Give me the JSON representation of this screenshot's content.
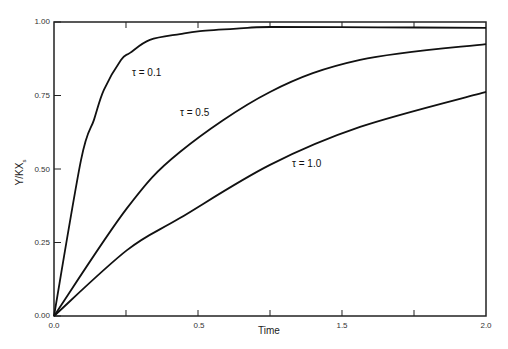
{
  "chart_data": {
    "type": "line",
    "title": "",
    "xlabel": "Time",
    "ylabel": "Y/KX_s",
    "ylabel_display": "Y/KX",
    "ylabel_sub": "s",
    "xlim": [
      0,
      2.0
    ],
    "ylim": [
      0,
      1.0
    ],
    "grid": false,
    "legend": "inline curve labels",
    "x_tick_labels": [
      {
        "pos": 0.0,
        "label": "0.0"
      },
      {
        "pos": 0.6667,
        "label": "0.5"
      },
      {
        "pos": 1.3333,
        "label": "1.5"
      },
      {
        "pos": 2.0,
        "label": "2.0"
      }
    ],
    "x_minor_ticks": [
      0.3333,
      0.6667,
      1.0,
      1.3333,
      1.6667
    ],
    "y_tick_labels": [
      {
        "pos": 0.0,
        "label": "0.00"
      },
      {
        "pos": 0.25,
        "label": "0.25"
      },
      {
        "pos": 0.5,
        "label": "0.50"
      },
      {
        "pos": 0.75,
        "label": "0.75"
      },
      {
        "pos": 1.0,
        "label": "1.00"
      }
    ],
    "series": [
      {
        "name": "τ = 0.1",
        "label_pos": [
          0.36,
          0.86
        ],
        "x": [
          0,
          0.125,
          0.185,
          0.231,
          0.31,
          0.352,
          0.444,
          0.583,
          0.676,
          0.86,
          1.0,
          1.5,
          2.0
        ],
        "y": [
          0,
          0.53,
          0.667,
          0.769,
          0.871,
          0.895,
          0.939,
          0.959,
          0.969,
          0.978,
          0.983,
          0.982,
          0.98
        ]
      },
      {
        "name": "τ = 0.5",
        "label_pos": [
          0.6,
          0.66
        ],
        "x": [
          0,
          0.338,
          0.583,
          1.0,
          1.417,
          2.0
        ],
        "y": [
          0,
          0.367,
          0.558,
          0.762,
          0.871,
          0.925
        ]
      },
      {
        "name": "τ = 1.0",
        "label_pos": [
          1.2,
          0.52
        ],
        "x": [
          0,
          0.338,
          0.583,
          1.0,
          1.417,
          2.0
        ],
        "y": [
          0,
          0.224,
          0.333,
          0.514,
          0.643,
          0.762
        ]
      }
    ]
  },
  "labels": {
    "xlabel": "Time",
    "ylabel_main": "Y/KX",
    "ylabel_sub": "s",
    "curve1": "τ = 0.1",
    "curve2": "τ = 0.5",
    "curve3": "τ = 1.0",
    "y0": "0.00",
    "y1": "0.25",
    "y2": "0.50",
    "y3": "0.75",
    "y4": "1.00",
    "x0": "0.0",
    "x1": "0.5",
    "x2": "1.5",
    "x3": "2.0"
  },
  "colors": {
    "line": "#111111",
    "axis": "#222222",
    "background": "#ffffff"
  }
}
